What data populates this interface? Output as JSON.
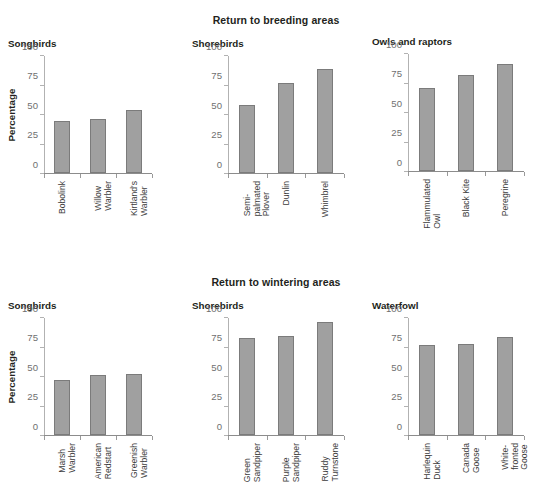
{
  "figure": {
    "supertitles": {
      "breeding": "Return to breeding areas",
      "wintering": "Return to wintering areas"
    },
    "ylabel": "Percentage",
    "yticks": [
      "0",
      "25",
      "50",
      "75",
      "100"
    ],
    "bar_color": "#a0a0a0",
    "bar_edge_color": "#7b7b7b",
    "axis_color": "#b2b2b2",
    "tick_label_color": "#6f6f6f"
  },
  "chart_data": [
    {
      "type": "bar",
      "title": "Songbirds",
      "supertitle": "Return to breeding areas",
      "categories": [
        "Bobolink",
        "Willow\nWarbler",
        "Kirtland's\nWarbler"
      ],
      "values": [
        44,
        46,
        53
      ],
      "xlabel": "",
      "ylabel": "Percentage",
      "ylim": [
        0,
        100
      ],
      "yticks": [
        0,
        25,
        50,
        75,
        100
      ],
      "grid": false,
      "legend": "none"
    },
    {
      "type": "bar",
      "title": "Shorebirds",
      "supertitle": "Return to breeding areas",
      "categories": [
        "Semi-\npalmated\nPlover",
        "Dunlin",
        "Whimbrel"
      ],
      "values": [
        58,
        76,
        88
      ],
      "xlabel": "",
      "ylabel": "",
      "ylim": [
        0,
        100
      ],
      "yticks": [
        0,
        25,
        50,
        75,
        100
      ],
      "grid": false,
      "legend": "none"
    },
    {
      "type": "bar",
      "title": "Owls and raptors",
      "supertitle": "Return to breeding areas",
      "categories": [
        "Flammulated\nOwl",
        "Black Kite",
        "Peregrine"
      ],
      "values": [
        70,
        81,
        91
      ],
      "xlabel": "",
      "ylabel": "",
      "ylim": [
        0,
        100
      ],
      "yticks": [
        0,
        25,
        50,
        75,
        100
      ],
      "grid": false,
      "legend": "none"
    },
    {
      "type": "bar",
      "title": "Songbirds",
      "supertitle": "Return to wintering areas",
      "categories": [
        "Marsh\nWarbler",
        "American\nRedstart",
        "Greenish\nWarbler"
      ],
      "values": [
        47,
        51,
        52
      ],
      "xlabel": "",
      "ylabel": "Percentage",
      "ylim": [
        0,
        100
      ],
      "yticks": [
        0,
        25,
        50,
        75,
        100
      ],
      "grid": false,
      "legend": "none"
    },
    {
      "type": "bar",
      "title": "Shorebirds",
      "supertitle": "Return to wintering areas",
      "categories": [
        "Green\nSandpiper",
        "Purple\nSandpiper",
        "Ruddy\nTurnstone"
      ],
      "values": [
        82,
        84,
        96
      ],
      "xlabel": "",
      "ylabel": "",
      "ylim": [
        0,
        100
      ],
      "yticks": [
        0,
        25,
        50,
        75,
        100
      ],
      "grid": false,
      "legend": "none"
    },
    {
      "type": "bar",
      "title": "Waterfowl",
      "supertitle": "Return to wintering areas",
      "categories": [
        "Harlequin\nDuck",
        "Canada\nGoose",
        "White-\nfronted\nGoose"
      ],
      "values": [
        76,
        77,
        83
      ],
      "xlabel": "",
      "ylabel": "",
      "ylim": [
        0,
        100
      ],
      "yticks": [
        0,
        25,
        50,
        75,
        100
      ],
      "grid": false,
      "legend": "none"
    }
  ]
}
